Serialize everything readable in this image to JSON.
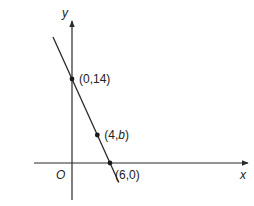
{
  "diagram": {
    "type": "coordinate-line-graph",
    "axes": {
      "x_label": "x",
      "y_label": "y",
      "origin_label": "O"
    },
    "line": {
      "description": "straight line through (0,14) and (6,0)",
      "color": "#2a2a2a"
    },
    "points": [
      {
        "id": "y-intercept",
        "x": 0,
        "y": 14,
        "label_pre": "(0,14)",
        "label_var": "",
        "label_post": ""
      },
      {
        "id": "mid-point",
        "x": 4,
        "y": 4.667,
        "label_pre": "(4,",
        "label_var": "b",
        "label_post": ")"
      },
      {
        "id": "x-intercept",
        "x": 6,
        "y": 0,
        "label_pre": "(6,0)",
        "label_var": "",
        "label_post": ""
      }
    ]
  }
}
